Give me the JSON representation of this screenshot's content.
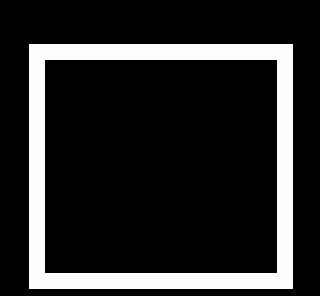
{
  "canvas": {
    "background": "#000000",
    "width": 320,
    "height": 296
  },
  "shape": {
    "type": "square-outline",
    "stroke_color": "#fdfdfd",
    "fill_color": "#000000",
    "outer_box": {
      "x": 29,
      "y": 44,
      "width": 264,
      "height": 245
    },
    "border_width": 16
  }
}
